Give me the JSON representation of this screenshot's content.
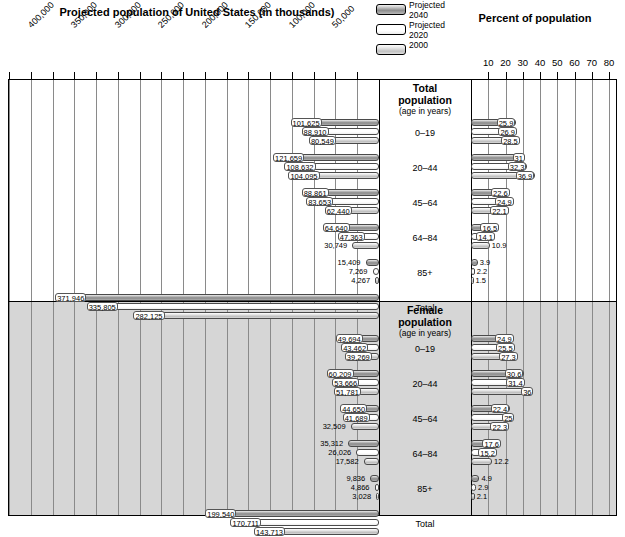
{
  "titles": {
    "left": "Projected population of United States (in thousands)",
    "right": "Percent of population"
  },
  "legend": [
    {
      "key": "p2040",
      "label": "Projected\n2040",
      "line1": "Projected",
      "line2": "2040",
      "swatch": "sw-2040",
      "color": "#8d8d8d"
    },
    {
      "key": "p2020",
      "label": "Projected\n2020",
      "line1": "Projected",
      "line2": "2020",
      "swatch": "sw-2020",
      "color": "#ffffff"
    },
    {
      "key": "y2000",
      "label": "2000",
      "line1": "2000",
      "line2": "",
      "swatch": "sw-2000",
      "color": "#c2c2c2"
    }
  ],
  "axes": {
    "left_ticks": [
      "400,000",
      "350,000",
      "300,000",
      "250,000",
      "200,000",
      "150,000",
      "100,000",
      "50,000"
    ],
    "left_max": 425000,
    "right_ticks": [
      "10",
      "20",
      "30",
      "40",
      "50",
      "60",
      "70",
      "80"
    ],
    "right_max": 84
  },
  "panels": [
    {
      "id": "total",
      "heading_line1": "Total",
      "heading_line2": "population",
      "heading_sub": "(age in years)",
      "groups": [
        {
          "age": "0–19",
          "counts": [
            101625,
            88910,
            80549
          ],
          "count_labels": [
            "101,625",
            "88,910",
            "80,549"
          ],
          "percents": [
            25.9,
            26.9,
            28.5
          ],
          "percent_labels": [
            "25.9",
            "26.9",
            "28.5"
          ]
        },
        {
          "age": "20–44",
          "counts": [
            121659,
            108632,
            104095
          ],
          "count_labels": [
            "121,659",
            "108,632",
            "104,095"
          ],
          "percents": [
            31,
            32.3,
            36.9
          ],
          "percent_labels": [
            "31",
            "32.3",
            "36.9"
          ]
        },
        {
          "age": "45–64",
          "counts": [
            88861,
            83653,
            62440
          ],
          "count_labels": [
            "88,861",
            "83,653",
            "62,440"
          ],
          "percents": [
            22.6,
            24.9,
            22.1
          ],
          "percent_labels": [
            "22.6",
            "24.9",
            "22.1"
          ]
        },
        {
          "age": "64–84",
          "counts": [
            64640,
            47363,
            30749
          ],
          "count_labels": [
            "64,640",
            "47,363",
            "30,749"
          ],
          "percents": [
            16.5,
            14.1,
            10.9
          ],
          "percent_labels": [
            "16.5",
            "14.1",
            "10.9"
          ]
        },
        {
          "age": "85+",
          "counts": [
            15409,
            7269,
            4267
          ],
          "count_labels": [
            "15,409",
            "7,269",
            "4,267"
          ],
          "percents": [
            3.9,
            2.2,
            1.5
          ],
          "percent_labels": [
            "3.9",
            "2.2",
            "1.5"
          ]
        },
        {
          "age": "Total",
          "counts": [
            371946,
            335805,
            282125
          ],
          "count_labels": [
            "371,946",
            "335,805",
            "282,125"
          ],
          "percents": [],
          "percent_labels": []
        }
      ]
    },
    {
      "id": "female",
      "heading_line1": "Female",
      "heading_line2": "population",
      "heading_sub": "(age in years)",
      "groups": [
        {
          "age": "0–19",
          "counts": [
            49694,
            43462,
            39269
          ],
          "count_labels": [
            "49,694",
            "43,462",
            "39,269"
          ],
          "percents": [
            24.9,
            25.5,
            27.3
          ],
          "percent_labels": [
            "24.9",
            "25.5",
            "27.3"
          ]
        },
        {
          "age": "20–44",
          "counts": [
            60209,
            53666,
            51781
          ],
          "count_labels": [
            "60,209",
            "53,666",
            "51,781"
          ],
          "percents": [
            30.6,
            31.4,
            36
          ],
          "percent_labels": [
            "30.6",
            "31.4",
            "36"
          ]
        },
        {
          "age": "45–64",
          "counts": [
            44650,
            41689,
            32509
          ],
          "count_labels": [
            "44,650",
            "41,689",
            "32,509"
          ],
          "percents": [
            22.4,
            25,
            22.3
          ],
          "percent_labels": [
            "22.4",
            "25",
            "22.3"
          ]
        },
        {
          "age": "64–84",
          "counts": [
            35312,
            26026,
            17582
          ],
          "count_labels": [
            "35,312",
            "26,026",
            "17,582"
          ],
          "percents": [
            17.6,
            15.2,
            12.2
          ],
          "percent_labels": [
            "17.6",
            "15.2",
            "12.2"
          ]
        },
        {
          "age": "85+",
          "counts": [
            9836,
            4866,
            3028
          ],
          "count_labels": [
            "9,836",
            "4,866",
            "3,028"
          ],
          "percents": [
            4.9,
            2.9,
            2.1
          ],
          "percent_labels": [
            "4.9",
            "2.9",
            "2.1"
          ]
        },
        {
          "age": "Total",
          "counts": [
            199540,
            170711,
            143713
          ],
          "count_labels": [
            "199,540",
            "170,711",
            "143,713"
          ],
          "percents": [],
          "percent_labels": []
        }
      ]
    }
  ],
  "chart_data": {
    "type": "bar",
    "xlabel": "Population (thousands) ← | → Percent of population",
    "ylabel": "Age in years",
    "grid": true,
    "legend_position": "top-center",
    "series": [
      {
        "name": "Projected 2040"
      },
      {
        "name": "Projected 2020"
      },
      {
        "name": "2000"
      }
    ],
    "categories": [
      "0–19",
      "20–44",
      "45–64",
      "64–84",
      "85+",
      "Total"
    ],
    "panels": [
      {
        "name": "Total population",
        "counts_thousands": {
          "Projected 2040": [
            101625,
            121659,
            88861,
            64640,
            15409,
            371946
          ],
          "Projected 2020": [
            88910,
            108632,
            83653,
            47363,
            7269,
            335805
          ],
          "2000": [
            80549,
            104095,
            62440,
            30749,
            4267,
            282125
          ]
        },
        "percent_of_population": {
          "Projected 2040": [
            25.9,
            31,
            22.6,
            16.5,
            3.9
          ],
          "Projected 2020": [
            26.9,
            32.3,
            24.9,
            14.1,
            2.2
          ],
          "2000": [
            28.5,
            36.9,
            22.1,
            10.9,
            1.5
          ]
        }
      },
      {
        "name": "Female population",
        "counts_thousands": {
          "Projected 2040": [
            49694,
            60209,
            44650,
            35312,
            9836,
            199540
          ],
          "Projected 2020": [
            43462,
            53666,
            41689,
            26026,
            4866,
            170711
          ],
          "2000": [
            39269,
            51781,
            32509,
            17582,
            3028,
            143713
          ]
        },
        "percent_of_population": {
          "Projected 2040": [
            24.9,
            30.6,
            22.4,
            17.6,
            4.9
          ],
          "Projected 2020": [
            25.5,
            31.4,
            25,
            15.2,
            2.9
          ],
          "2000": [
            27.3,
            36,
            22.3,
            12.2,
            2.1
          ]
        }
      }
    ],
    "left_axis_ticks": [
      400000,
      350000,
      300000,
      250000,
      200000,
      150000,
      100000,
      50000
    ],
    "right_axis_ticks": [
      10,
      20,
      30,
      40,
      50,
      60,
      70,
      80
    ]
  }
}
